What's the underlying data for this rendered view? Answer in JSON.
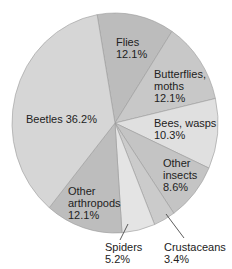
{
  "chart_data": {
    "type": "pie",
    "title": "",
    "center": [
      115,
      123
    ],
    "radius": [
      103,
      110
    ],
    "start_angle_deg": -10,
    "direction": "clockwise",
    "slices": [
      {
        "name": "Flies",
        "value": 12.1,
        "color": "#bcbcbc",
        "label_lines": [
          "Flies",
          "12.1%"
        ],
        "label_pos": [
          116,
          36
        ]
      },
      {
        "name": "Butterflies, moths",
        "value": 12.1,
        "color": "#c8c8c8",
        "label_lines": [
          "Butterflies,",
          "moths",
          "12.1%"
        ],
        "label_pos": [
          154,
          68
        ]
      },
      {
        "name": "Bees, wasps",
        "value": 10.3,
        "color": "#e0e0e0",
        "label_lines": [
          "Bees, wasps",
          "10.3%"
        ],
        "label_pos": [
          154,
          117
        ]
      },
      {
        "name": "Other insects",
        "value": 8.6,
        "color": "#c4c4c4",
        "label_lines": [
          "Other",
          "insects",
          "8.6%"
        ],
        "label_pos": [
          163,
          157
        ]
      },
      {
        "name": "Crustaceans",
        "value": 3.4,
        "color": "#cbcbcb",
        "label_lines": [
          "Crustaceans",
          "3.4%"
        ],
        "label_pos": [
          164,
          241
        ]
      },
      {
        "name": "Spiders",
        "value": 5.2,
        "color": "#e4e4e4",
        "label_lines": [
          "Spiders",
          "5.2%"
        ],
        "label_pos": [
          105,
          241
        ]
      },
      {
        "name": "Other arthropods",
        "value": 12.1,
        "color": "#bdbdbd",
        "label_lines": [
          "Other",
          "arthropods",
          "12.1%"
        ],
        "label_pos": [
          68,
          185
        ]
      },
      {
        "name": "Beetles",
        "value": 36.2,
        "color": "#d6d6d6",
        "label_lines": [
          "Beetles 36.2%"
        ],
        "label_pos": [
          26,
          113
        ]
      }
    ],
    "leader_lines": [
      {
        "slice": "Spiders",
        "from": [
          128,
          224
        ],
        "to": [
          120,
          240
        ]
      },
      {
        "slice": "Crustaceans",
        "from": [
          166,
          214
        ],
        "to": [
          184,
          238
        ]
      }
    ]
  }
}
